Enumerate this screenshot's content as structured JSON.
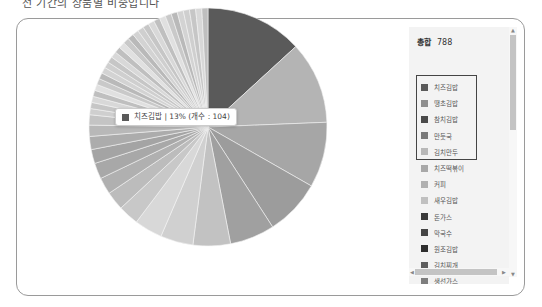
{
  "caption": "전 기간의 상품별 비중입니다",
  "legend": {
    "total_label": "총합",
    "total_value": "788",
    "items": [
      {
        "label": "치즈김밥",
        "color": "#5a5a5a",
        "selected": true
      },
      {
        "label": "땡초김밥",
        "color": "#8e8e8e",
        "selected": true
      },
      {
        "label": "참치김밥",
        "color": "#4a4a4a",
        "selected": true
      },
      {
        "label": "만둣국",
        "color": "#7a7a7a",
        "selected": true
      },
      {
        "label": "김치만두",
        "color": "#b8b8b8",
        "selected": true
      },
      {
        "label": "치즈떡볶이",
        "color": "#a8a8a8",
        "selected": false
      },
      {
        "label": "커피",
        "color": "#b0b0b0",
        "selected": false
      },
      {
        "label": "새우김밥",
        "color": "#c0c0c0",
        "selected": false
      },
      {
        "label": "돈가스",
        "color": "#3a3a3a",
        "selected": false
      },
      {
        "label": "막국수",
        "color": "#454545",
        "selected": false
      },
      {
        "label": "원조김밥",
        "color": "#2e2e2e",
        "selected": false
      },
      {
        "label": "김치찌개",
        "color": "#5e5e5e",
        "selected": false
      },
      {
        "label": "생선가스",
        "color": "#7e7e7e",
        "selected": false
      },
      {
        "label": "오므라이스",
        "color": "#9a9a9a",
        "selected": false
      },
      {
        "label": "치킨마요덮밥",
        "color": "#505050",
        "selected": false
      },
      {
        "label": "고기만두",
        "color": "#909090",
        "selected": false
      }
    ]
  },
  "tooltip": {
    "text": "치즈김밥 | 13% (개수 : 104)",
    "color": "#5a5a5a"
  },
  "chart_data": {
    "type": "pie",
    "title": "",
    "total": 788,
    "legend_position": "right",
    "labels": [
      "치즈김밥",
      "땡초김밥",
      "참치김밥",
      "만둣국",
      "김치만두",
      "치즈떡볶이",
      "커피",
      "새우김밥",
      "돈가스",
      "막국수",
      "원조김밥",
      "김치찌개",
      "생선가스",
      "오므라이스",
      "치킨마요덮밥",
      "고기만두",
      "기타(다수)"
    ],
    "values": [
      104,
      88,
      70,
      60,
      48,
      40,
      35,
      30,
      22,
      20,
      18,
      17,
      15,
      14,
      12,
      11,
      184
    ],
    "percent": [
      13,
      11,
      9,
      8,
      6,
      5,
      4,
      4,
      3,
      3,
      2,
      2,
      2,
      2,
      2,
      1,
      23
    ],
    "colors": [
      "#5a5a5a",
      "#b4b4b4",
      "#a6a6a6",
      "#9c9c9c",
      "#a0a0a0",
      "#c2c2c2",
      "#d0d0d0",
      "#d8d8d8",
      "#c8c8c8",
      "#bcbcbc",
      "#b0b0b0",
      "#a8a8a8",
      "#a4a4a4",
      "#acacac",
      "#b8b8b8",
      "#c4c4c4",
      "#cccccc"
    ],
    "start_angle_deg": 0,
    "direction": "clockwise",
    "note": "Only 치즈김밥 (104, 13%) is labeled; other values are estimated from slice angles."
  }
}
